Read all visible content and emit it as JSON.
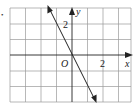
{
  "figure": {
    "bullet": "•",
    "grid": {
      "columns": 8,
      "rows": 6,
      "x_min": -4,
      "x_max": 4,
      "y_min": -3,
      "y_max": 3,
      "color": "#9a9a9a"
    },
    "axes": {
      "x_label": "x",
      "y_label": "y",
      "origin_label": "O",
      "x_tick_label": "2",
      "y_tick_label": "2",
      "color": "#222222"
    },
    "line": {
      "equation": "y = -2x",
      "slope": -2,
      "intercept": 0,
      "arrows": "both",
      "color": "#222222"
    }
  }
}
